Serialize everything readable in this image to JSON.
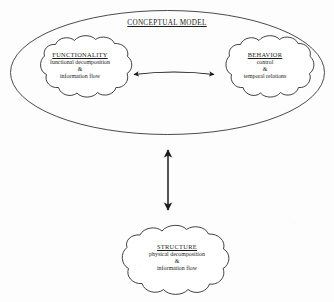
{
  "diagram": {
    "title": "CONCEPTUAL MODEL",
    "background_color": "#fdfdfd",
    "ink_color": "#1b1b1b",
    "nodes": [
      {
        "id": "functionality",
        "shape": "cloud",
        "title": "FUNCTIONALITY",
        "lines": [
          "functional decomposition",
          "&",
          "information flow"
        ],
        "inside_container": "CONCEPTUAL MODEL"
      },
      {
        "id": "behavior",
        "shape": "cloud",
        "title": "BEHAVIOR",
        "lines": [
          "control",
          "&",
          "temporal relations"
        ],
        "inside_container": "CONCEPTUAL MODEL"
      },
      {
        "id": "structure",
        "shape": "cloud",
        "title": "STRUCTURE",
        "lines": [
          "physical decomposition",
          "&",
          "information flow"
        ],
        "inside_container": null
      }
    ],
    "container": {
      "id": "conceptual-model",
      "shape": "ellipse",
      "label": "CONCEPTUAL MODEL"
    },
    "connectors": [
      {
        "id": "functionality-behavior",
        "from": "functionality",
        "to": "behavior",
        "style": "double-headed arrow",
        "orientation": "horizontal"
      },
      {
        "id": "conceptual-structure",
        "from": "conceptual-model",
        "to": "structure",
        "style": "double-headed arrow",
        "orientation": "vertical"
      }
    ]
  }
}
